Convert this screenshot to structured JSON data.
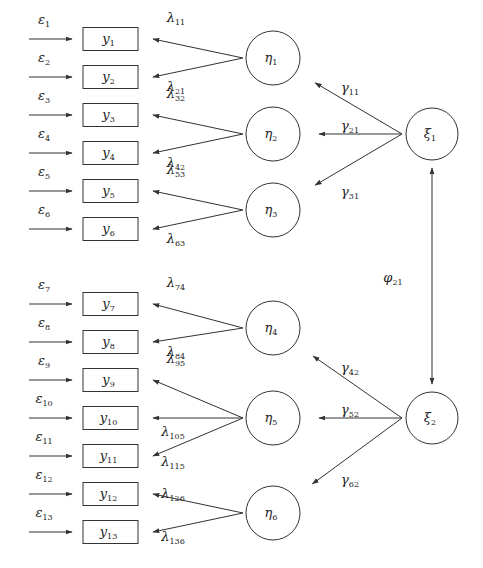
{
  "diagram": {
    "type": "structural-equation-model",
    "observed": [
      {
        "id": "y1",
        "base": "y",
        "sub": "1",
        "cy": 39,
        "error": {
          "base": "ε",
          "sub": "1"
        }
      },
      {
        "id": "y2",
        "base": "y",
        "sub": "2",
        "cy": 77,
        "error": {
          "base": "ε",
          "sub": "2"
        }
      },
      {
        "id": "y3",
        "base": "y",
        "sub": "3",
        "cy": 115,
        "error": {
          "base": "ε",
          "sub": "3"
        }
      },
      {
        "id": "y4",
        "base": "y",
        "sub": "4",
        "cy": 153,
        "error": {
          "base": "ε",
          "sub": "4"
        }
      },
      {
        "id": "y5",
        "base": "y",
        "sub": "5",
        "cy": 191,
        "error": {
          "base": "ε",
          "sub": "5"
        }
      },
      {
        "id": "y6",
        "base": "y",
        "sub": "6",
        "cy": 229,
        "error": {
          "base": "ε",
          "sub": "6"
        }
      },
      {
        "id": "y7",
        "base": "y",
        "sub": "7",
        "cy": 304,
        "error": {
          "base": "ε",
          "sub": "7"
        }
      },
      {
        "id": "y8",
        "base": "y",
        "sub": "8",
        "cy": 342,
        "error": {
          "base": "ε",
          "sub": "8"
        }
      },
      {
        "id": "y9",
        "base": "y",
        "sub": "9",
        "cy": 380,
        "error": {
          "base": "ε",
          "sub": "9"
        }
      },
      {
        "id": "y10",
        "base": "y",
        "sub": "10",
        "cy": 418,
        "error": {
          "base": "ε",
          "sub": "10"
        }
      },
      {
        "id": "y11",
        "base": "y",
        "sub": "11",
        "cy": 456,
        "error": {
          "base": "ε",
          "sub": "11"
        }
      },
      {
        "id": "y12",
        "base": "y",
        "sub": "12",
        "cy": 494,
        "error": {
          "base": "ε",
          "sub": "12"
        }
      },
      {
        "id": "y13",
        "base": "y",
        "sub": "13",
        "cy": 532,
        "error": {
          "base": "ε",
          "sub": "13"
        }
      }
    ],
    "endogenous": [
      {
        "id": "eta1",
        "base": "η",
        "sub": "1",
        "cx": 273,
        "cy": 58
      },
      {
        "id": "eta2",
        "base": "η",
        "sub": "2",
        "cx": 273,
        "cy": 134
      },
      {
        "id": "eta3",
        "base": "η",
        "sub": "3",
        "cx": 273,
        "cy": 210
      },
      {
        "id": "eta4",
        "base": "η",
        "sub": "4",
        "cx": 273,
        "cy": 328
      },
      {
        "id": "eta5",
        "base": "η",
        "sub": "5",
        "cx": 273,
        "cy": 418
      },
      {
        "id": "eta6",
        "base": "η",
        "sub": "6",
        "cx": 273,
        "cy": 513
      }
    ],
    "exogenous": [
      {
        "id": "xi1",
        "base": "ξ",
        "sub": "1",
        "cx": 432,
        "cy": 134
      },
      {
        "id": "xi2",
        "base": "ξ",
        "sub": "2",
        "cx": 432,
        "cy": 418
      }
    ],
    "loadings": [
      {
        "from": "eta1",
        "to": "y1",
        "base": "λ",
        "sub": "11",
        "lx": 176,
        "ly": 22,
        "above": true
      },
      {
        "from": "eta1",
        "to": "y2",
        "base": "λ",
        "sub": "21",
        "lx": 176,
        "ly": 91,
        "above": false
      },
      {
        "from": "eta2",
        "to": "y3",
        "base": "λ",
        "sub": "32",
        "lx": 176,
        "ly": 98,
        "above": true
      },
      {
        "from": "eta2",
        "to": "y4",
        "base": "λ",
        "sub": "42",
        "lx": 176,
        "ly": 167,
        "above": false
      },
      {
        "from": "eta3",
        "to": "y5",
        "base": "λ",
        "sub": "53",
        "lx": 176,
        "ly": 174,
        "above": true
      },
      {
        "from": "eta3",
        "to": "y6",
        "base": "λ",
        "sub": "63",
        "lx": 176,
        "ly": 243,
        "above": false
      },
      {
        "from": "eta4",
        "to": "y7",
        "base": "λ",
        "sub": "74",
        "lx": 176,
        "ly": 287,
        "above": true
      },
      {
        "from": "eta4",
        "to": "y8",
        "base": "λ",
        "sub": "84",
        "lx": 176,
        "ly": 356,
        "above": false
      },
      {
        "from": "eta5",
        "to": "y9",
        "base": "λ",
        "sub": "95",
        "lx": 176,
        "ly": 363,
        "above": true
      },
      {
        "from": "eta5",
        "to": "y10",
        "base": "λ",
        "sub": "105",
        "lx": 173,
        "ly": 436,
        "above": false
      },
      {
        "from": "eta5",
        "to": "y11",
        "base": "λ",
        "sub": "115",
        "lx": 173,
        "ly": 466,
        "above": false
      },
      {
        "from": "eta6",
        "to": "y12",
        "base": "λ",
        "sub": "126",
        "lx": 173,
        "ly": 498,
        "above": true
      },
      {
        "from": "eta6",
        "to": "y13",
        "base": "λ",
        "sub": "136",
        "lx": 173,
        "ly": 541,
        "above": false
      }
    ],
    "paths": [
      {
        "from": "xi1",
        "to": "eta1",
        "base": "γ",
        "sub": "11",
        "lx": 350,
        "ly": 92
      },
      {
        "from": "xi1",
        "to": "eta2",
        "base": "γ",
        "sub": "21",
        "lx": 350,
        "ly": 130
      },
      {
        "from": "xi1",
        "to": "eta3",
        "base": "γ",
        "sub": "31",
        "lx": 350,
        "ly": 196
      },
      {
        "from": "xi2",
        "to": "eta4",
        "base": "γ",
        "sub": "42",
        "lx": 350,
        "ly": 372
      },
      {
        "from": "xi2",
        "to": "eta5",
        "base": "γ",
        "sub": "52",
        "lx": 350,
        "ly": 414
      },
      {
        "from": "xi2",
        "to": "eta6",
        "base": "γ",
        "sub": "62",
        "lx": 350,
        "ly": 484
      }
    ],
    "covariance": {
      "between": [
        "xi1",
        "xi2"
      ],
      "base": "φ",
      "sub": "21",
      "lx": 393,
      "ly": 282
    }
  }
}
